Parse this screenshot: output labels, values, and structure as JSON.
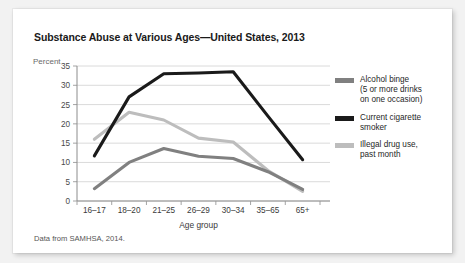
{
  "figure": {
    "title": "Substance Abuse at Various Ages—United States, 2013",
    "source_note": "Data from SAMHSA, 2014.",
    "card_background": "#ffffff",
    "page_background": "#f2f2f2"
  },
  "chart_data": {
    "type": "line",
    "title": "Substance Abuse at Various Ages—United States, 2013",
    "xlabel": "Age group",
    "ylabel": "Percent",
    "ylim": [
      0,
      35
    ],
    "yticks": [
      0,
      5,
      10,
      15,
      20,
      25,
      30,
      35
    ],
    "ytick_labels": [
      "0",
      "5",
      "10",
      "15",
      "20",
      "25",
      "30",
      "35"
    ],
    "grid": true,
    "grid_axis": "y",
    "legend_position": "right",
    "categories": [
      "16–17",
      "18–20",
      "21–25",
      "26–29",
      "30–34",
      "35–65",
      "65+"
    ],
    "series": [
      {
        "name": "Alcohol binge\n(5 or more drinks\non one occasion)",
        "short_name": "Alcohol binge",
        "color": "#808080",
        "values": [
          3.2,
          10.0,
          13.6,
          11.6,
          11.0,
          7.6,
          3.0
        ]
      },
      {
        "name": "Current cigarette\nsmoker",
        "short_name": "Current cigarette smoker",
        "color": "#1a1a1a",
        "values": [
          11.7,
          27.0,
          33.0,
          33.2,
          33.5,
          22.0,
          10.7
        ]
      },
      {
        "name": "Illegal drug use,\npast month",
        "short_name": "Illegal drug use, past month",
        "color": "#bdbdbd",
        "values": [
          16.0,
          23.0,
          21.0,
          16.3,
          15.3,
          7.9,
          2.5
        ]
      }
    ]
  },
  "legend": {
    "entries": [
      {
        "label": "Alcohol binge\n(5 or more drinks\non one occasion)",
        "color": "#808080"
      },
      {
        "label": "Current cigarette\nsmoker",
        "color": "#1a1a1a"
      },
      {
        "label": "Illegal drug use,\npast month",
        "color": "#bdbdbd"
      }
    ]
  }
}
